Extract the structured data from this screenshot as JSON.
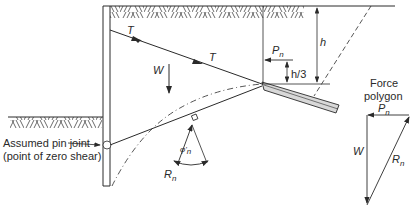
{
  "diagram": {
    "type": "anchored sheet pile wall free-body diagram",
    "labels": {
      "tie_upper": "T",
      "tie_lower": "T",
      "weight": "W",
      "anchor_force": "P",
      "anchor_force_sub": "n",
      "height": "h",
      "third_height": "h/3",
      "reaction": "R",
      "reaction_sub": "n",
      "friction_angle": "φ'",
      "friction_angle_sub": "n",
      "pin_joint_line1": "Assumed pin joint",
      "pin_joint_line2": "(point of zero shear)",
      "force_polygon_line1": "Force",
      "force_polygon_line2": "polygon",
      "poly_anchor_force": "P",
      "poly_anchor_force_sub": "n",
      "poly_weight": "W",
      "poly_reaction": "R",
      "poly_reaction_sub": "n"
    },
    "colors": {
      "line": "#2a2a2a",
      "anchor_fill": "#d8d8d8",
      "background": "#ffffff"
    }
  }
}
